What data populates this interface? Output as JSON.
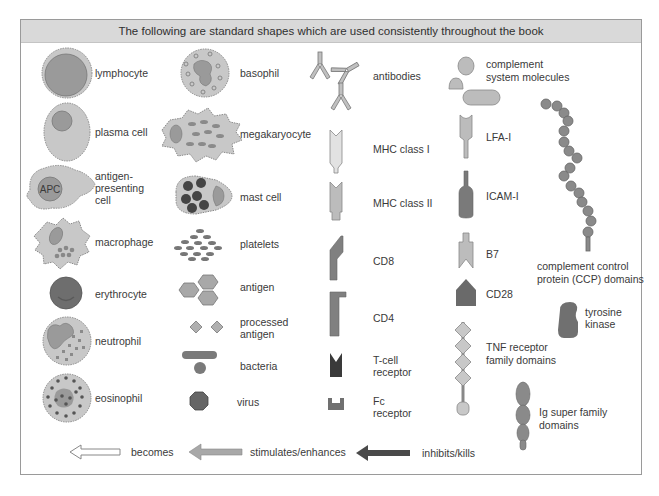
{
  "header": {
    "title": "The following are standard shapes which are used consistently throughout the book"
  },
  "colors": {
    "cell_fill": "#c8c8c8",
    "nucleus": "#9a9a9a",
    "dark": "#555555",
    "mid": "#808080",
    "light": "#d0d0d0",
    "header_bg": "#d9d9d9",
    "border": "#9a9a9a"
  },
  "column1": [
    {
      "id": "lymphocyte",
      "label": "lymphocyte",
      "icon": "lymphocyte-icon"
    },
    {
      "id": "plasma-cell",
      "label": "plasma cell",
      "icon": "plasma-cell-icon"
    },
    {
      "id": "apc",
      "label_lines": [
        "antigen-",
        "presenting",
        "cell"
      ],
      "icon": "apc-icon",
      "icon_text": "APC"
    },
    {
      "id": "macrophage",
      "label": "macrophage",
      "icon": "macrophage-icon"
    },
    {
      "id": "erythrocyte",
      "label": "erythrocyte",
      "icon": "erythrocyte-icon"
    },
    {
      "id": "neutrophil",
      "label": "neutrophil",
      "icon": "neutrophil-icon"
    },
    {
      "id": "eosinophil",
      "label": "eosinophil",
      "icon": "eosinophil-icon"
    }
  ],
  "column2": [
    {
      "id": "basophil",
      "label": "basophil",
      "icon": "basophil-icon"
    },
    {
      "id": "megakaryocyte",
      "label": "megakaryocyte",
      "icon": "megakaryocyte-icon"
    },
    {
      "id": "mast-cell",
      "label": "mast cell",
      "icon": "mast-cell-icon"
    },
    {
      "id": "platelets",
      "label": "platelets",
      "icon": "platelets-icon"
    },
    {
      "id": "antigen",
      "label": "antigen",
      "icon": "antigen-icon"
    },
    {
      "id": "processed-antigen",
      "label_lines": [
        "processed",
        "antigen"
      ],
      "icon": "processed-antigen-icon"
    },
    {
      "id": "bacteria",
      "label": "bacteria",
      "icon": "bacteria-icon"
    },
    {
      "id": "virus",
      "label": "virus",
      "icon": "virus-icon"
    }
  ],
  "column3": [
    {
      "id": "antibodies",
      "label": "antibodies",
      "icon": "antibodies-icon"
    },
    {
      "id": "mhc-class-1",
      "label": "MHC class I",
      "icon": "mhc-class-1-icon"
    },
    {
      "id": "mhc-class-2",
      "label": "MHC class II",
      "icon": "mhc-class-2-icon"
    },
    {
      "id": "cd8",
      "label": "CD8",
      "icon": "cd8-icon"
    },
    {
      "id": "cd4",
      "label": "CD4",
      "icon": "cd4-icon"
    },
    {
      "id": "tcr",
      "label_lines": [
        "T-cell",
        "receptor"
      ],
      "icon": "t-cell-receptor-icon"
    },
    {
      "id": "fc-receptor",
      "label_lines": [
        "Fc",
        "receptor"
      ],
      "icon": "fc-receptor-icon"
    }
  ],
  "column4": [
    {
      "id": "complement",
      "label_lines": [
        "complement",
        "system molecules"
      ],
      "icon": "complement-icon"
    },
    {
      "id": "lfa1",
      "label": "LFA-I",
      "icon": "lfa-1-icon"
    },
    {
      "id": "icam1",
      "label": "ICAM-I",
      "icon": "icam-1-icon"
    },
    {
      "id": "b7",
      "label": "B7",
      "icon": "b7-icon"
    },
    {
      "id": "cd28",
      "label": "CD28",
      "icon": "cd28-icon"
    },
    {
      "id": "tnf-receptor",
      "label_lines": [
        "TNF receptor",
        "family domains"
      ],
      "icon": "tnf-receptor-icon"
    }
  ],
  "column5": [
    {
      "id": "ccp",
      "label_lines": [
        "complement control",
        "protein (CCP) domains"
      ],
      "icon": "ccp-domains-icon"
    },
    {
      "id": "tyrosine-kinase",
      "label_lines": [
        "tyrosine",
        "kinase"
      ],
      "icon": "tyrosine-kinase-icon"
    },
    {
      "id": "ig-superfamily",
      "label_lines": [
        "Ig super family",
        "domains"
      ],
      "icon": "ig-superfamily-icon"
    }
  ],
  "arrows": [
    {
      "id": "becomes",
      "label": "becomes",
      "style": "outline"
    },
    {
      "id": "stimulates",
      "label": "stimulates/enhances",
      "style": "medium-gray"
    },
    {
      "id": "inhibits",
      "label": "inhibits/kills",
      "style": "dark-gray"
    }
  ]
}
